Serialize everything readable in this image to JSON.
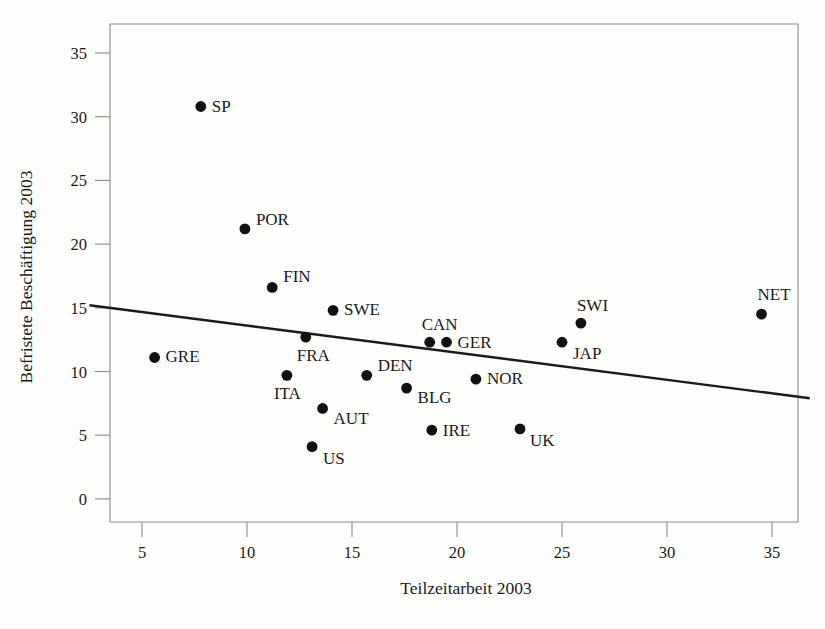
{
  "chart_data": {
    "type": "scatter",
    "title": "",
    "xlabel": "Teilzeitarbeit 2003",
    "ylabel": "Befristete Beschäftigung 2003",
    "xlim": [
      2.5,
      36.8
    ],
    "ylim": [
      -1.4,
      36.5
    ],
    "xticks": [
      5,
      10,
      15,
      20,
      25,
      30,
      35
    ],
    "xticklabels": [
      "5",
      "10",
      "15",
      "20",
      "25",
      "30",
      "35"
    ],
    "yticks": [
      0,
      5,
      10,
      15,
      20,
      25,
      30,
      35
    ],
    "yticklabels": [
      "0",
      "5",
      "10",
      "15",
      "20",
      "25",
      "30",
      "35"
    ],
    "grid": false,
    "legend": false,
    "marker_color": "#111111",
    "trendline_color": "#1a1a1a",
    "axis_color": "#8a8a8a",
    "points": [
      {
        "label": "SP",
        "x": 7.8,
        "y": 30.8,
        "label_dx": 11,
        "label_dy": 5
      },
      {
        "label": "POR",
        "x": 9.9,
        "y": 21.2,
        "label_dx": 11,
        "label_dy": -4
      },
      {
        "label": "FIN",
        "x": 11.2,
        "y": 16.6,
        "label_dx": 11,
        "label_dy": -5
      },
      {
        "label": "SWE",
        "x": 14.1,
        "y": 14.8,
        "label_dx": 11,
        "label_dy": 5
      },
      {
        "label": "GRE",
        "x": 5.6,
        "y": 11.1,
        "label_dx": 11,
        "label_dy": 5
      },
      {
        "label": "FRA",
        "x": 12.8,
        "y": 12.7,
        "label_dx": -9,
        "label_dy": 24
      },
      {
        "label": "CAN",
        "x": 18.7,
        "y": 12.3,
        "label_dx": -8,
        "label_dy": -12
      },
      {
        "label": "GER",
        "x": 19.5,
        "y": 12.3,
        "label_dx": 11,
        "label_dy": 6
      },
      {
        "label": "SWI",
        "x": 25.9,
        "y": 13.8,
        "label_dx": -4,
        "label_dy": -12
      },
      {
        "label": "JAP",
        "x": 25.0,
        "y": 12.3,
        "label_dx": 11,
        "label_dy": 17
      },
      {
        "label": "NET",
        "x": 34.5,
        "y": 14.5,
        "label_dx": -4,
        "label_dy": -14
      },
      {
        "label": "ITA",
        "x": 11.9,
        "y": 9.7,
        "label_dx": -13,
        "label_dy": 24
      },
      {
        "label": "DEN",
        "x": 15.7,
        "y": 9.7,
        "label_dx": 11,
        "label_dy": -4
      },
      {
        "label": "BLG",
        "x": 17.6,
        "y": 8.7,
        "label_dx": 11,
        "label_dy": 15
      },
      {
        "label": "NOR",
        "x": 20.9,
        "y": 9.4,
        "label_dx": 11,
        "label_dy": 5
      },
      {
        "label": "AUT",
        "x": 13.6,
        "y": 7.1,
        "label_dx": 11,
        "label_dy": 16
      },
      {
        "label": "IRE",
        "x": 18.8,
        "y": 5.4,
        "label_dx": 11,
        "label_dy": 6
      },
      {
        "label": "UK",
        "x": 23.0,
        "y": 5.5,
        "label_dx": 10,
        "label_dy": 17
      },
      {
        "label": "US",
        "x": 13.1,
        "y": 4.1,
        "label_dx": 11,
        "label_dy": 17
      }
    ],
    "trendline": {
      "x_start": 2.5,
      "y_start": 15.2,
      "x_end": 36.8,
      "y_end": 7.9
    }
  }
}
